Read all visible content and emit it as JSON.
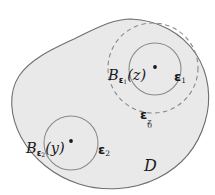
{
  "figure": {
    "kind": "set-diagram",
    "background_color": "#ffffff",
    "domain": {
      "name": "D",
      "label": "D",
      "fill_color": "#e9e9e9",
      "stroke_color": "#6e6e6e"
    },
    "balls": [
      {
        "id": "ball-z",
        "label_prefix": "B",
        "label_subscript": "ε",
        "label_subscript_index": "1",
        "label_argument": "(z)",
        "radius_label": "ε",
        "radius_label_index": "1",
        "center_point": "z",
        "style": "solid",
        "stroke_color": "#8a8a8a"
      },
      {
        "id": "ball-y",
        "label_prefix": "B",
        "label_subscript": "ε",
        "label_subscript_index": "2",
        "label_argument": "(y)",
        "radius_label": "ε",
        "radius_label_index": "2",
        "center_point": "y",
        "style": "solid",
        "stroke_color": "#8a8a8a"
      }
    ],
    "dashed_region": {
      "id": "eps0z",
      "label_base": "ε",
      "label_subscript": "0",
      "label_superscript": "z",
      "style": "dashed",
      "stroke_color": "#8a8a8a"
    }
  }
}
